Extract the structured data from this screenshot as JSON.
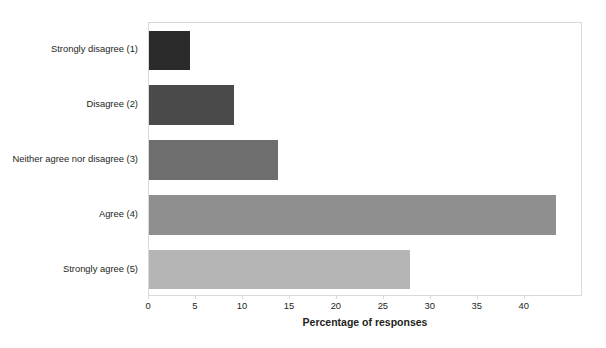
{
  "chart_data": {
    "type": "bar",
    "orientation": "horizontal",
    "title": "",
    "xlabel": "Percentage of responses",
    "ylabel": "",
    "categories": [
      "Strongly disagree (1)",
      "Disagree (2)",
      "Neither agree nor disagree (3)",
      "Agree (4)",
      "Strongly agree (5)"
    ],
    "values": [
      4.4,
      9.0,
      13.7,
      43.3,
      27.8
    ],
    "colors": [
      "#2b2b2b",
      "#4a4a4a",
      "#6e6e6e",
      "#8f8f8f",
      "#b5b5b5"
    ],
    "xlim": [
      0,
      46.2
    ],
    "xticks": [
      0,
      5,
      10,
      15,
      20,
      25,
      30,
      35,
      40
    ],
    "xtick_labels": [
      "0",
      "5",
      "10",
      "15",
      "20",
      "25",
      "30",
      "35",
      "40"
    ],
    "grid": false,
    "legend": false
  }
}
